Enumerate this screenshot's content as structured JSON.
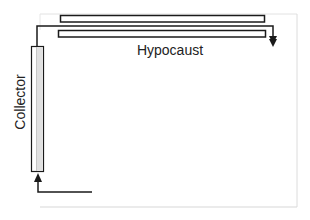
{
  "diagram": {
    "labels": {
      "hypocaust": "Hypocaust",
      "collector": "Collector"
    },
    "colors": {
      "stroke": "#1a1a1a",
      "frame": "#dcdcdc",
      "collector_fill": "#e6e6e6",
      "background": "#ffffff"
    }
  }
}
